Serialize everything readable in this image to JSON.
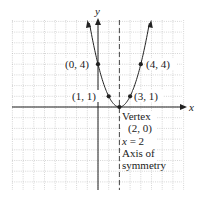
{
  "chart_data": {
    "type": "line",
    "title": "",
    "function": "y = (x - 2)^2",
    "xlabel": "x",
    "ylabel": "y",
    "xlim": [
      -8,
      8
    ],
    "ylim": [
      -8,
      8
    ],
    "grid": true,
    "points": [
      {
        "x": 0,
        "y": 4,
        "label": "(0, 4)"
      },
      {
        "x": 4,
        "y": 4,
        "label": "(4, 4)"
      },
      {
        "x": 1,
        "y": 1,
        "label": "(1, 1)"
      },
      {
        "x": 3,
        "y": 1,
        "label": "(3, 1)"
      },
      {
        "x": 2,
        "y": 0,
        "label": "Vertex"
      }
    ],
    "annotations": {
      "vertex_title": "Vertex",
      "vertex_coords": "(2, 0)",
      "axis_eq": "x = 2",
      "axis_line1": "Axis of",
      "axis_line2": "symmetry"
    }
  },
  "labels": {
    "x_axis": "x",
    "y_axis": "y",
    "p04": "(0, 4)",
    "p44": "(4, 4)",
    "p11": "(1, 1)",
    "p31": "(3, 1)",
    "vertex_title": "Vertex",
    "vertex_coords": "(2, 0)",
    "axis_eq_x": "x",
    "axis_eq_rest": " = 2",
    "axis_line1": "Axis of",
    "axis_line2": "symmetry"
  }
}
